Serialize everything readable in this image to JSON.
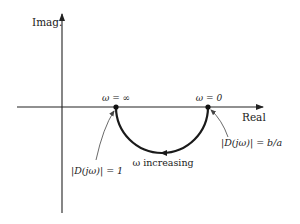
{
  "diagram": {
    "axes": {
      "y_label": "Imag.",
      "x_label": "Real"
    },
    "points": {
      "w_infinity": "ω = ∞",
      "w_zero": "ω = 0"
    },
    "annotations": {
      "direction": "ω increasing",
      "magnitude_at_infinity": "|D(jω)| = 1",
      "magnitude_at_zero": "|D(jω)| = b/a"
    },
    "colors": {
      "stroke": "#222222",
      "background": "#ffffff"
    }
  }
}
